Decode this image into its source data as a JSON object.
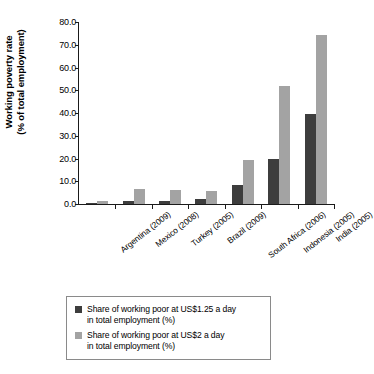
{
  "chart_data": {
    "type": "bar",
    "title": "",
    "subtitle": "",
    "xlabel": "",
    "ylabel": "Working poverty rate\n(% of total employment)",
    "ylabel_line1": "Working poverty rate",
    "ylabel_line2": "(% of total employment)",
    "ylim": [
      0.0,
      80.0
    ],
    "ytick_labels": [
      "80.0",
      "70.0",
      "60.0",
      "50.0",
      "40.0",
      "30.0",
      "20.0",
      "10.0",
      "0.0"
    ],
    "ytick_values": [
      80.0,
      70.0,
      60.0,
      50.0,
      40.0,
      30.0,
      20.0,
      10.0,
      0.0
    ],
    "grid": false,
    "legend_position": "bottom",
    "categories": [
      "Argentina (2009)",
      "Mexico (2008)",
      "Turkey (2005)",
      "Brazil (2009)",
      "South Africa (2006)",
      "Indonesia (2005)",
      "India (2005)"
    ],
    "series": [
      {
        "name": "Share of working poor at US$1.25 a day in total employment (%)",
        "legend_line1": "Share of working poor at US$1.25 a day",
        "legend_line2": "in total employment (%)",
        "color": "#3d3d3d",
        "values": [
          0.5,
          1.2,
          1.3,
          2.0,
          8.2,
          19.8,
          39.4
        ]
      },
      {
        "name": "Share of working poor at US$2 a day in total employment (%)",
        "legend_line1": "Share of working poor at US$2 a day",
        "legend_line2": "in total employment (%)",
        "color": "#a3a3a3",
        "values": [
          1.4,
          6.6,
          6.2,
          5.8,
          19.4,
          51.8,
          74.5
        ]
      }
    ]
  }
}
